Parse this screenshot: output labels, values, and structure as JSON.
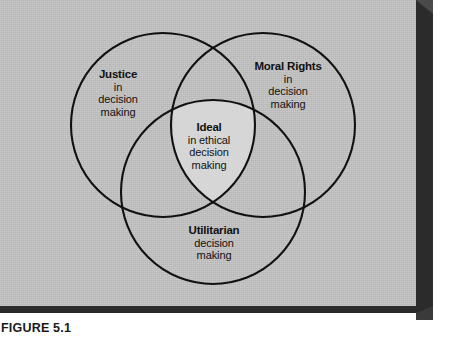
{
  "figure": {
    "caption": "FIGURE 5.1",
    "title": "",
    "background_color": "#c3c3c3",
    "shadow_color": "#2b2b2b",
    "stroke_color": "#111111",
    "intersection_color": "#d6d6d6"
  },
  "diagram": {
    "type": "venn",
    "set_count": 3,
    "sets": [
      {
        "id": "justice",
        "heading": "Justice",
        "lines": [
          "in",
          "decision",
          "making"
        ],
        "position": "top-left"
      },
      {
        "id": "moral-rights",
        "heading": "Moral Rights",
        "lines": [
          "in",
          "decision",
          "making"
        ],
        "position": "top-right"
      },
      {
        "id": "utilitarian",
        "heading": "Utilitarian",
        "lines": [
          "decision",
          "making"
        ],
        "position": "bottom-center"
      }
    ],
    "intersection": {
      "id": "ideal",
      "heading": "Ideal",
      "lines": [
        "in ethical",
        "decision",
        "making"
      ],
      "position": "center"
    }
  }
}
